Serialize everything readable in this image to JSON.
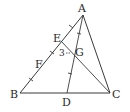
{
  "diagram": {
    "type": "geometry-triangle",
    "points": {
      "A": {
        "label": "A",
        "x": 83,
        "y": 15
      },
      "B": {
        "label": "B",
        "x": 20,
        "y": 93
      },
      "C": {
        "label": "C",
        "x": 110,
        "y": 93
      },
      "D": {
        "label": "D",
        "x": 67,
        "y": 93
      },
      "E": {
        "label": "E",
        "x": 61,
        "y": 41
      },
      "F": {
        "label": "F",
        "x": 42,
        "y": 66
      },
      "G": {
        "label": "G",
        "x": 74,
        "y": 53
      }
    },
    "segments": [
      "AB",
      "BC",
      "CA",
      "AD",
      "EC"
    ],
    "annotations": {
      "length_label": "3",
      "length_label_target": "EG"
    },
    "colors": {
      "line": "#3a3a3a",
      "text": "#2a2a2a",
      "background": "#ffffff"
    }
  }
}
